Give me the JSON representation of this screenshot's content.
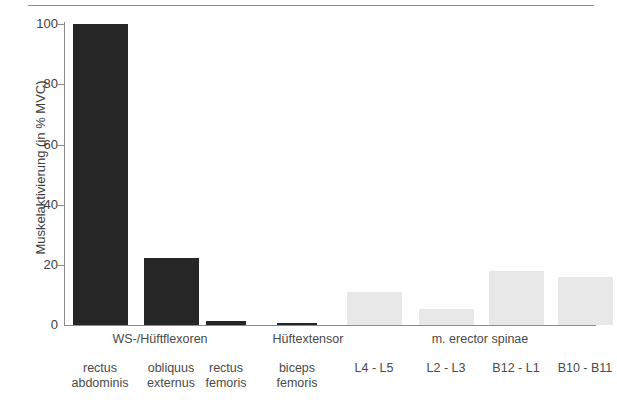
{
  "chart_data": {
    "type": "bar",
    "title": "",
    "subtitle": "",
    "xlabel": "",
    "ylabel": "Muskelaktivierung (in % MVC)",
    "ylim": [
      0,
      100
    ],
    "yticks": [
      0,
      20,
      40,
      60,
      80,
      100
    ],
    "ytick_labels": [
      "0",
      "20",
      "40",
      "60",
      "80",
      "100"
    ],
    "grid": false,
    "legend": "none",
    "categories": [
      "rectus\nabdominis",
      "obliquus\nexternus",
      "rectus\nfemoris",
      "biceps\nfemoris",
      "L4 - L5",
      "L2 - L3",
      "B12 - L1",
      "B10 - B11"
    ],
    "values": [
      100,
      22.1,
      1.3,
      0.3,
      11,
      5.3,
      18,
      16
    ],
    "bar_colors": [
      "#262626",
      "#262626",
      "#262626",
      "#262626",
      "#e8e8e8",
      "#e8e8e8",
      "#e8e8e8",
      "#e8e8e8"
    ],
    "group_labels": [
      "WS-/Hüftflexoren",
      "Hüftextensor",
      "m. erector spinae"
    ],
    "axis_color": "#8c8c8c",
    "text_color": "#4a4a4a"
  },
  "categories": [
    {
      "line1": "rectus",
      "line2": "abdominis"
    },
    {
      "line1": "obliquus",
      "line2": "externus"
    },
    {
      "line1": "rectus",
      "line2": "femoris"
    },
    {
      "line1": "biceps",
      "line2": "femoris"
    },
    {
      "line1": "L4 - L5",
      "line2": ""
    },
    {
      "line1": "L2 - L3",
      "line2": ""
    },
    {
      "line1": "B12 - L1",
      "line2": ""
    },
    {
      "line1": "B10 - B11",
      "line2": ""
    }
  ],
  "groups": [
    {
      "label": "WS-/Hüftflexoren"
    },
    {
      "label": "Hüftextensor"
    },
    {
      "label": "m. erector spinae"
    }
  ],
  "yticks": [
    {
      "label": "100"
    },
    {
      "label": "80"
    },
    {
      "label": "60"
    },
    {
      "label": "40"
    },
    {
      "label": "20"
    },
    {
      "label": "0"
    }
  ],
  "axis": {
    "ylabel": "Muskelaktivierung (in % MVC)"
  }
}
